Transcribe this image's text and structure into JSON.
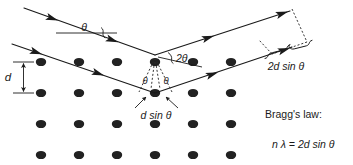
{
  "figure": {
    "background_color": "#ffffff",
    "ink_color": "#1a1a1a",
    "atom_color": "#222222"
  },
  "labels": {
    "theta_incident": "θ",
    "two_theta": "2θ",
    "theta_left": "θ",
    "theta_right": "θ",
    "d_spacing": "d",
    "path_difference_single": "d sin θ",
    "path_difference_total": "2d sin θ",
    "law_heading": "Bragg's law:",
    "law_equation": "n λ = 2d sin θ"
  },
  "law": {
    "heading": "Bragg's law:",
    "equation": "n λ = 2d sin θ",
    "symbols": {
      "n": "order of reflection",
      "lambda": "λ",
      "d": "d",
      "theta": "θ"
    }
  },
  "lattice": {
    "rows": 4,
    "columns": 6,
    "x_start": 41,
    "x_step": 38,
    "y_rows": [
      62,
      93,
      124,
      155
    ],
    "dot_rx": 5.2,
    "dot_ry": 4.1
  },
  "geometry": {
    "top_vertex": {
      "x": 155,
      "y": 55
    },
    "bottom_vertex": {
      "x": 155,
      "y": 93
    },
    "incident_rays": 2,
    "outgoing_rays": 2,
    "incidence_angle_label": "θ",
    "scattering_angle_label": "2θ"
  }
}
